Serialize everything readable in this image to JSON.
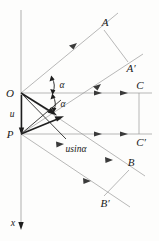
{
  "figure": {
    "type": "geometry-diagram",
    "background_color": "#fdfdfc",
    "line_color": "#9a9a9a",
    "emphasis_color": "#1e1e1e",
    "points": {
      "O": {
        "label": "O",
        "x": 21,
        "y": 93
      },
      "P": {
        "label": "P",
        "x": 21,
        "y": 134
      },
      "A": {
        "label": "A",
        "x": 104,
        "y": 22
      },
      "A_prime": {
        "label": "A′",
        "x": 128,
        "y": 68
      },
      "B": {
        "label": "B",
        "x": 129,
        "y": 162
      },
      "B_prime": {
        "label": "B′",
        "x": 103,
        "y": 203
      },
      "C": {
        "label": "C",
        "x": 137,
        "y": 86
      },
      "C_prime": {
        "label": "C′",
        "x": 137,
        "y": 137
      }
    },
    "labels": {
      "segment_u": "u",
      "projection": "usinα",
      "angle_upper": "α",
      "angle_lower": "α",
      "axis_x": "x"
    },
    "angles": {
      "upper_alpha_symbol": "α",
      "lower_alpha_symbol": "α"
    },
    "axes": {
      "vertical_axis_label": "x",
      "vertical_axis_direction": "downward"
    }
  }
}
